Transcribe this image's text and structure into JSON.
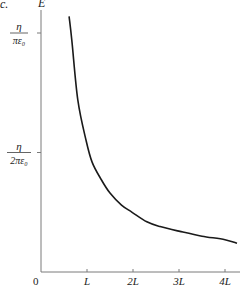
{
  "figure": {
    "panel_label": "c.",
    "ylabel": "E",
    "origin_label": "0",
    "xticks": [
      {
        "label": "L",
        "value": 1
      },
      {
        "label": "2L",
        "value": 2
      },
      {
        "label": "3L",
        "value": 3
      },
      {
        "label": "4L",
        "value": 4
      }
    ],
    "yticks": [
      {
        "numerator": "η",
        "denominator": "πε₀",
        "value": 1.0
      },
      {
        "numerator": "η",
        "denominator": "2πε₀",
        "value": 0.5
      }
    ],
    "colors": {
      "axis": "#7a7a7a",
      "curve": "#1a1a1a",
      "text": "#222222"
    }
  },
  "chart_data": {
    "type": "line",
    "title": "",
    "xlabel": "",
    "ylabel": "E",
    "x_units": "L",
    "y_units": "η/(πε₀)",
    "xlim": [
      0,
      4.3
    ],
    "ylim": [
      0,
      1.1
    ],
    "grid": false,
    "legend": null,
    "x_tick_labels": [
      "0",
      "L",
      "2L",
      "3L",
      "4L"
    ],
    "y_tick_labels": [
      "η/(2πε₀)",
      "η/(πε₀)"
    ],
    "series": [
      {
        "name": "E(x)",
        "x": [
          0.61,
          0.67,
          0.8,
          0.98,
          1.11,
          1.3,
          1.5,
          1.75,
          1.98,
          2.3,
          2.59,
          3.02,
          3.5,
          4.0,
          4.26
        ],
        "y": [
          1.07,
          0.97,
          0.72,
          0.55,
          0.46,
          0.39,
          0.33,
          0.28,
          0.25,
          0.21,
          0.19,
          0.17,
          0.15,
          0.135,
          0.12
        ]
      }
    ]
  }
}
